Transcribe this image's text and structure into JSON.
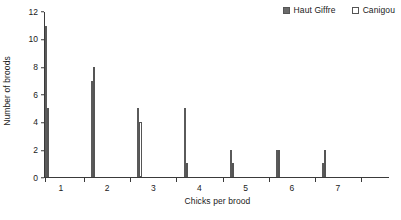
{
  "chart_data": {
    "type": "bar",
    "title": "",
    "subtitle": "",
    "xlabel": "Chicks per brood",
    "ylabel": "Number of broods",
    "categories": [
      "1",
      "2",
      "3",
      "4",
      "5",
      "6",
      "7"
    ],
    "series": [
      {
        "name": "Haut Giffre",
        "values": [
          11,
          7,
          5,
          5,
          2,
          2,
          1
        ],
        "style": "filled",
        "color": "#6a6a6a"
      },
      {
        "name": "Canigou",
        "values": [
          5,
          8,
          4,
          1,
          1,
          2,
          2
        ],
        "style": "open",
        "color": "#ffffff"
      }
    ],
    "ylim": [
      0,
      12
    ],
    "yticks": [
      0,
      2,
      4,
      6,
      8,
      10,
      12
    ],
    "ytick_labels": [
      "0",
      "2",
      "4",
      "6",
      "8",
      "10",
      "12"
    ],
    "grid": false,
    "legend_position": "top-right",
    "annotations": []
  },
  "legend": {
    "items": [
      {
        "label": "Haut Giffre",
        "swatch": "filled-square-icon",
        "color": "#6a6a6a"
      },
      {
        "label": "Canigou",
        "swatch": "open-square-icon",
        "color": "#ffffff"
      }
    ]
  }
}
